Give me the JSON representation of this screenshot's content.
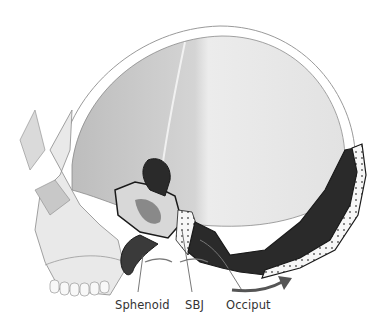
{
  "figure": {
    "labels": [
      {
        "id": "sphenoid",
        "text": "Sphenoid"
      },
      {
        "id": "sbj",
        "text": "SBJ"
      },
      {
        "id": "occiput",
        "text": "Occiput"
      }
    ],
    "colors": {
      "bone_light": "#e6e6e6",
      "bone_shade": "#cfcfcf",
      "section_dark": "#2a2a2a",
      "outline": "#1a1a1a",
      "label_text": "#333333",
      "arrow": "#555555"
    }
  }
}
